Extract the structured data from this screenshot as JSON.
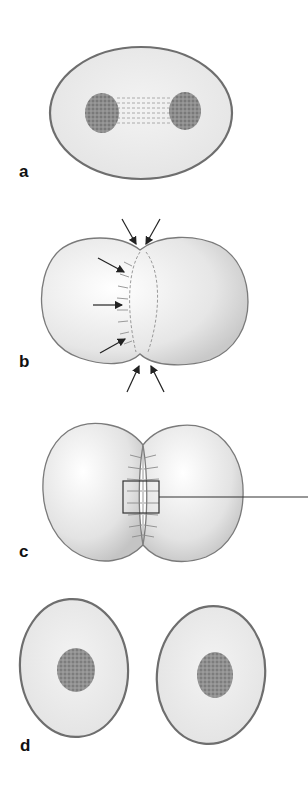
{
  "figure": {
    "panels": [
      {
        "id": "a",
        "label": "a",
        "description": "Late anaphase/telophase cell with two chromatin masses connected by spindle fibres"
      },
      {
        "id": "b",
        "label": "b",
        "description": "Cleavage furrow forming; arrows indicate contractile ring constriction"
      },
      {
        "id": "c",
        "label": "c",
        "description": "Deepened cleavage furrow with boxed region and callout line"
      },
      {
        "id": "d",
        "label": "d",
        "description": "Two separated daughter cells, each with a nucleus"
      }
    ]
  },
  "colors": {
    "cell_fill": "#ececec",
    "cell_outline": "#6e6e6e",
    "chromatin": "#8a8a8a",
    "arrow": "#222222",
    "label": "#111111"
  }
}
